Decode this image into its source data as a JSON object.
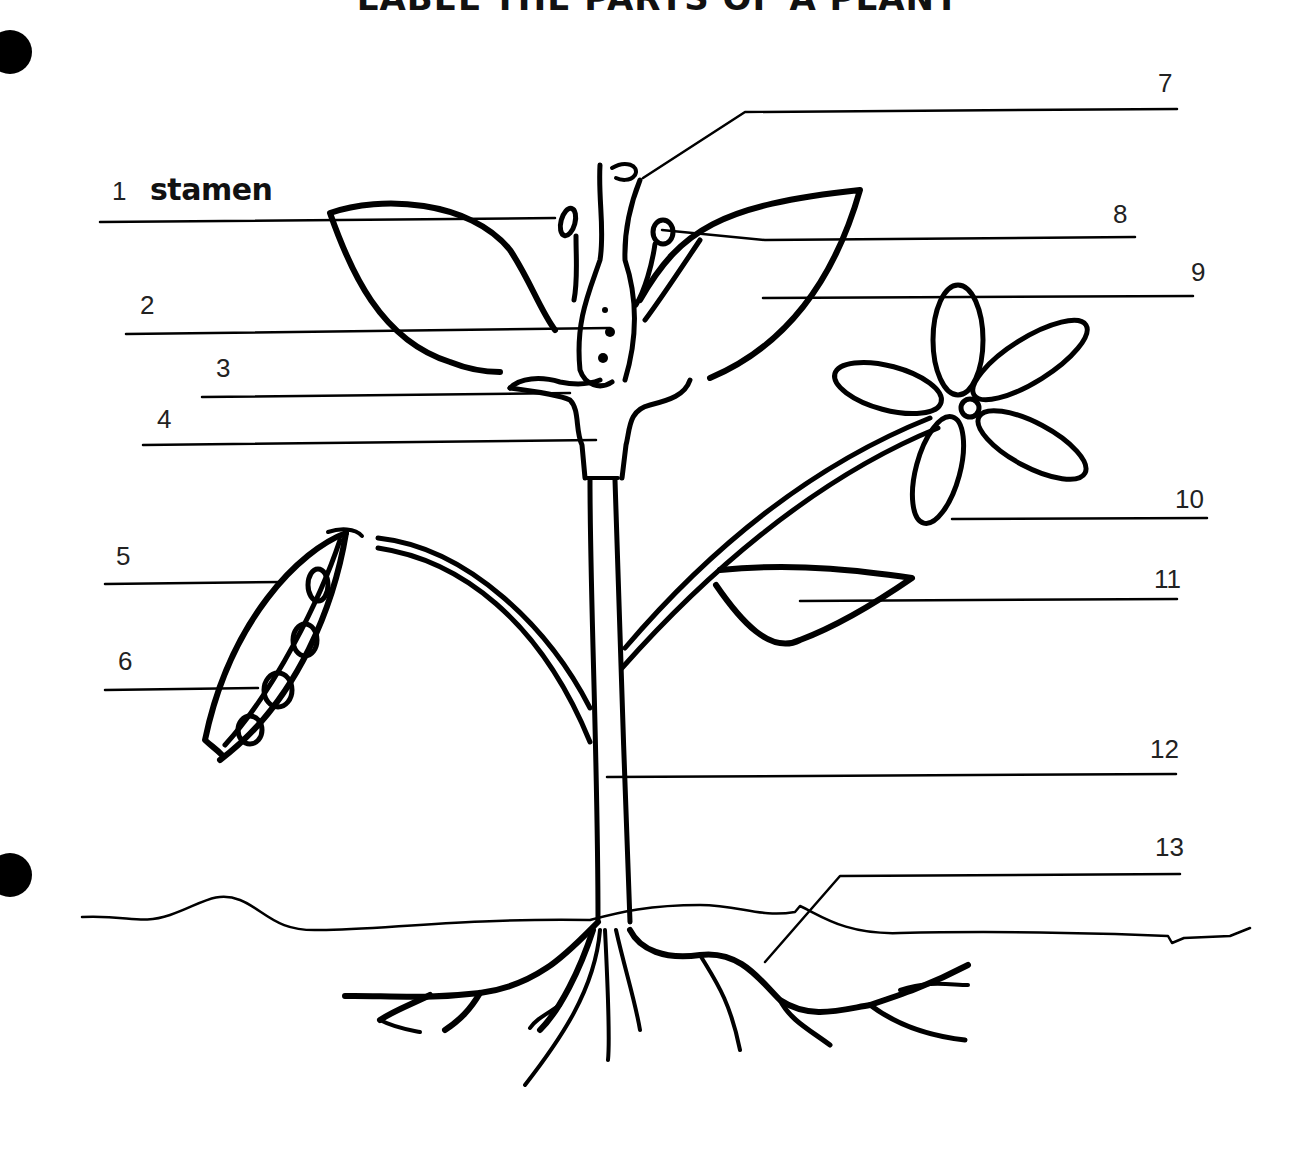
{
  "worksheet": {
    "title": "LABEL THE PARTS OF A PLANT",
    "colors": {
      "ink": "#000000",
      "paper": "#ffffff"
    }
  },
  "labels": [
    {
      "number": "1",
      "answer": "stamen"
    },
    {
      "number": "2",
      "answer": ""
    },
    {
      "number": "3",
      "answer": ""
    },
    {
      "number": "4",
      "answer": ""
    },
    {
      "number": "5",
      "answer": ""
    },
    {
      "number": "6",
      "answer": ""
    },
    {
      "number": "7",
      "answer": ""
    },
    {
      "number": "8",
      "answer": ""
    },
    {
      "number": "9",
      "answer": ""
    },
    {
      "number": "10",
      "answer": ""
    },
    {
      "number": "11",
      "answer": ""
    },
    {
      "number": "12",
      "answer": ""
    },
    {
      "number": "13",
      "answer": ""
    }
  ]
}
